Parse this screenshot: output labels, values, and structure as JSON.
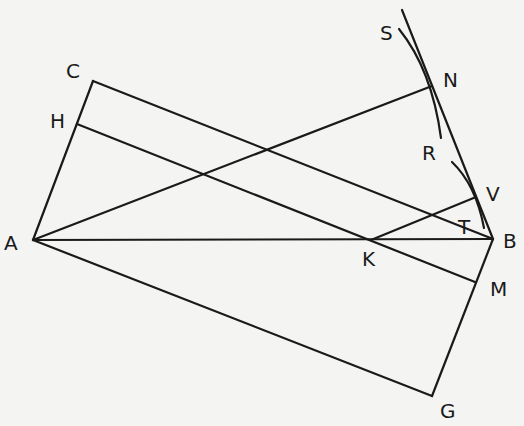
{
  "diagram": {
    "type": "geometric-construction",
    "background": "#f4f4f2",
    "stroke_color": "#1a1a1a",
    "points": {
      "A": {
        "label": "A",
        "x": 33,
        "y": 240
      },
      "B": {
        "label": "B",
        "x": 493,
        "y": 239
      },
      "C": {
        "label": "C",
        "x": 93,
        "y": 81
      },
      "H": {
        "label": "H",
        "x": 77,
        "y": 124
      },
      "N": {
        "label": "N",
        "x": 432,
        "y": 86
      },
      "S": {
        "label": "S",
        "x": 399,
        "y": 29
      },
      "R": {
        "label": "R",
        "x": 440,
        "y": 139
      },
      "V": {
        "label": "V",
        "x": 476,
        "y": 197
      },
      "T": {
        "label": "T",
        "x": 468,
        "y": 226
      },
      "K": {
        "label": "K",
        "x": 371,
        "y": 240
      },
      "M": {
        "label": "M",
        "x": 475,
        "y": 282
      },
      "G": {
        "label": "G",
        "x": 432,
        "y": 396
      }
    },
    "segments": [
      "AC",
      "CB",
      "HM",
      "AN",
      "AB",
      "AG",
      "GB",
      "KV",
      "VB",
      "tangent through N to B"
    ],
    "arcs": [
      "S-N-R arc",
      "arc near V through T"
    ]
  }
}
